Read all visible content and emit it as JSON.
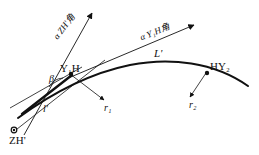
{
  "figure": {
    "type": "survey-curve-diagram",
    "width": 259,
    "height": 155,
    "background_color": "#ffffff",
    "stroke_color": "#111111"
  },
  "labels": {
    "point_zh": "ZH'",
    "point_y1h": "Y₁H",
    "point_hy2": "HY₂",
    "angle_beta": "β",
    "chord_large": "L'",
    "chord_small": "l'",
    "offset_r1": "r₁",
    "offset_r2": "r₂",
    "azimuth_zh": "α ZH'角",
    "azimuth_y1h": "α Y₁H角"
  },
  "azimuth_zh_parts": {
    "symbol": "α",
    "subscript": "ZH'",
    "suffix": "角"
  },
  "azimuth_y1h_parts": {
    "symbol": "α",
    "subscript": "Y₁H",
    "suffix": "角"
  },
  "geometry": {
    "curve_path": "M 18,118 C 48,96 86,74 130,65 C 170,57 214,62 248,86",
    "tangent_from_zh": "M 12,133 L 105,60",
    "tangent_short": "M 10,108 L 82,67",
    "azimuth_ray_zh": "M 24,135 L 92,13",
    "azimuth_ray_y1h": "M 66,79 L 194,25",
    "offset_ray_r1": "M 70,74 L 104,100",
    "offset_ray_r2": "M 206,73 L 190,97",
    "thick_chord": "M 22,114 L 72,75",
    "station_zh": {
      "x": 14,
      "y": 130,
      "r": 2.6
    },
    "station_y1h": {
      "x": 71,
      "y": 74,
      "r": 2.2
    },
    "station_hy2": {
      "x": 207,
      "y": 73,
      "r": 2.2
    }
  }
}
